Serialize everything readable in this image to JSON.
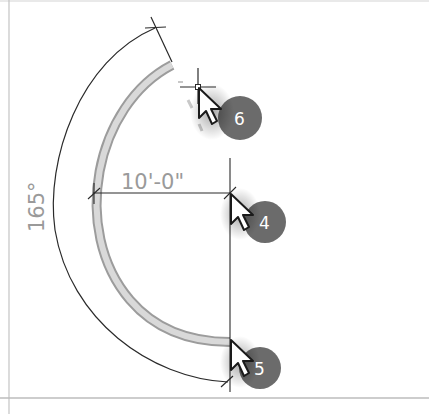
{
  "diagram": {
    "dimensions": {
      "radius_label": "10'-0\"",
      "angle_label": "165°"
    },
    "steps": [
      {
        "number": "6",
        "description": "cursor at wall end snap point (top)"
      },
      {
        "number": "4",
        "description": "cursor at arc center point"
      },
      {
        "number": "5",
        "description": "cursor at wall start point (bottom)"
      }
    ],
    "colors": {
      "wall_fill": "#d6d6d6",
      "wall_edge": "#9a9a9a",
      "dimension_line": "#2a2a2a",
      "dimension_text": "#9a9a9a",
      "badge_fill": "#6b6b6b",
      "frame_line": "#bdbdbd"
    }
  }
}
